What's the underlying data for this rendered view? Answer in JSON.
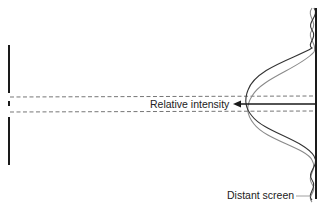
{
  "diagram": {
    "type": "single-slit-diffraction",
    "labels": {
      "relative_intensity": "Relative intensity",
      "distant_screen": "Distant screen"
    },
    "colors": {
      "background": "#ffffff",
      "barrier": "#1a1a1a",
      "screen": "#1a1a1a",
      "dashed_lines": "#666666",
      "curve_primary": "#333333",
      "curve_secondary": "#8a8a8a",
      "arrow": "#1a1a1a",
      "leader_line": "#888888"
    },
    "elements": {
      "barrier": {
        "description": "Vertical barrier with a slit opening on the left"
      },
      "screen": {
        "description": "Vertical distant screen on the right"
      },
      "intensity_curves": {
        "count": 2,
        "description": "Two overlapping intensity distributions drawn against the screen"
      },
      "beam_edges": {
        "count": 2,
        "style": "dashed"
      }
    }
  }
}
